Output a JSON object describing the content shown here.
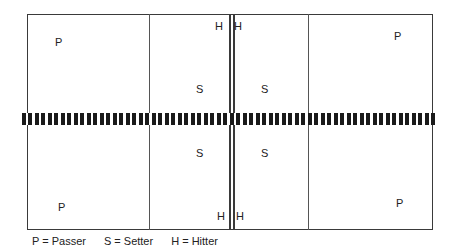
{
  "diagram": {
    "type": "volleyball-court-positions",
    "court": {
      "outer_line_color": "#3a3a3a",
      "net_color": "#1a1a1a"
    },
    "players": {
      "top_left_passer": "P",
      "top_left_hitter": "H",
      "top_left_setter": "S",
      "top_right_hitter": "H",
      "top_right_setter": "S",
      "top_right_passer": "P",
      "bottom_left_setter": "S",
      "bottom_left_passer": "P",
      "bottom_left_hitter": "H",
      "bottom_right_setter": "S",
      "bottom_right_hitter": "H",
      "bottom_right_passer": "P"
    },
    "legend": [
      {
        "symbol": "P",
        "meaning": "Passer",
        "text": "P = Passer"
      },
      {
        "symbol": "S",
        "meaning": "Setter",
        "text": "S = Setter"
      },
      {
        "symbol": "H",
        "meaning": "Hitter",
        "text": "H = Hitter"
      }
    ]
  }
}
